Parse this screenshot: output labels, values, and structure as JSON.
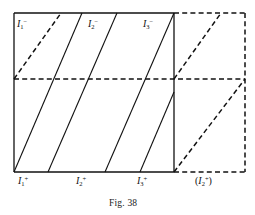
{
  "figure": {
    "caption": "Fig. 38",
    "caption_x": 109,
    "caption_y": 198,
    "background_color": "#ffffff",
    "line_color": "#111111"
  },
  "geometry": {
    "square": {
      "x0": 14,
      "y0": 13,
      "x1": 174,
      "y1": 172
    },
    "right_region": {
      "x0": 174,
      "y0": 13,
      "x1": 245,
      "y1": 172
    },
    "midline_y": 79,
    "solid_diagonals": [
      {
        "x_bottom": 14,
        "x_top": 82
      },
      {
        "x_bottom": 48,
        "x_top": 117
      },
      {
        "x_bottom": 105,
        "x_top": 174
      }
    ],
    "dashed_diagonals_left": [
      {
        "x_bottom": 14,
        "y_bottom": 79,
        "x_top": 61,
        "y_top": 13
      }
    ],
    "dashed_diagonals_right": [
      {
        "x_bottom": 174,
        "y_bottom": 79,
        "x_top": 221,
        "y_top": 13
      },
      {
        "x_bottom": 174,
        "y_bottom": 172,
        "x_top": 245,
        "y_top": 79
      }
    ]
  },
  "labels": {
    "top": [
      {
        "id": "I1-minus",
        "base": "I",
        "sub": "1",
        "sup": "−",
        "x": 17,
        "y": 19
      },
      {
        "id": "I2-minus",
        "base": "I",
        "sub": "2",
        "sup": "−",
        "x": 88,
        "y": 19
      },
      {
        "id": "I3-minus",
        "base": "I",
        "sub": "3",
        "sup": "−",
        "x": 143,
        "y": 19
      }
    ],
    "bottom": [
      {
        "id": "I1-plus",
        "base": "I",
        "sub": "1",
        "sup": "+",
        "x": 18,
        "y": 176,
        "paren": false
      },
      {
        "id": "I2-plus",
        "base": "I",
        "sub": "2",
        "sup": "+",
        "x": 76,
        "y": 176,
        "paren": false
      },
      {
        "id": "I3-plus",
        "base": "I",
        "sub": "3",
        "sup": "+",
        "x": 137,
        "y": 176,
        "paren": false
      },
      {
        "id": "I2-plus-paren",
        "base": "I",
        "sub": "2",
        "sup": "+",
        "x": 195,
        "y": 176,
        "paren": true
      }
    ]
  }
}
